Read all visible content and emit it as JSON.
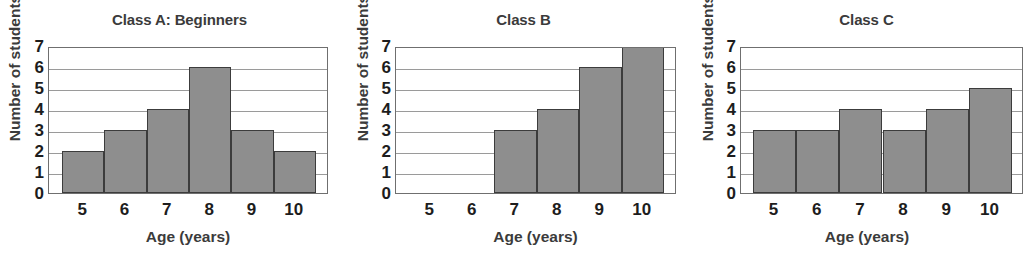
{
  "figure": {
    "background_color": "#ffffff",
    "bar_fill_color": "#8e8e8e",
    "bar_edge_color": "#3c3c3c",
    "gridline_color": "#9a9a9a",
    "axis_color": "#6f6f6f",
    "text_color": "#3b3b3b"
  },
  "chart_data": [
    {
      "type": "bar",
      "title": "Class A: Beginners",
      "xlabel": "Age (years)",
      "ylabel": "Number of students",
      "categories": [
        "5",
        "6",
        "7",
        "8",
        "9",
        "10"
      ],
      "values": [
        2,
        3,
        4,
        6,
        3,
        2
      ],
      "ylim": [
        0,
        7
      ],
      "yticks": [
        "0",
        "1",
        "2",
        "3",
        "4",
        "5",
        "6",
        "7"
      ],
      "grid": true,
      "legend": "none"
    },
    {
      "type": "bar",
      "title": "Class B",
      "xlabel": "Age (years)",
      "ylabel": "Number of students",
      "categories": [
        "5",
        "6",
        "7",
        "8",
        "9",
        "10"
      ],
      "values": [
        0,
        0,
        3,
        4,
        6,
        7
      ],
      "ylim": [
        0,
        7
      ],
      "yticks": [
        "0",
        "1",
        "2",
        "3",
        "4",
        "5",
        "6",
        "7"
      ],
      "grid": true,
      "legend": "none"
    },
    {
      "type": "bar",
      "title": "Class C",
      "xlabel": "Age (years)",
      "ylabel": "Number of students",
      "categories": [
        "5",
        "6",
        "7",
        "8",
        "9",
        "10"
      ],
      "values": [
        3,
        3,
        4,
        3,
        4,
        5
      ],
      "ylim": [
        0,
        7
      ],
      "yticks": [
        "0",
        "1",
        "2",
        "3",
        "4",
        "5",
        "6",
        "7"
      ],
      "grid": true,
      "legend": "none"
    }
  ]
}
